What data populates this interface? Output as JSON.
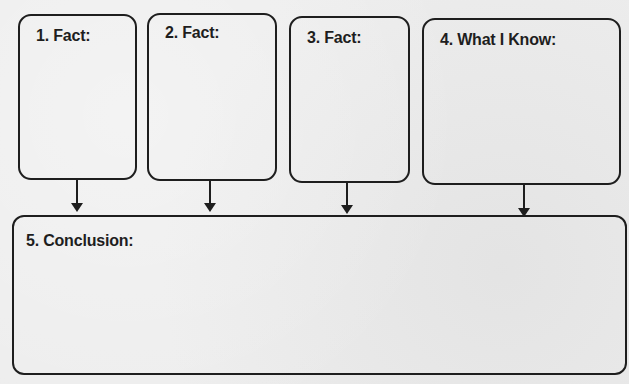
{
  "diagram": {
    "type": "graphic-organizer",
    "boxes": [
      {
        "id": 1,
        "label": "1. Fact:"
      },
      {
        "id": 2,
        "label": "2. Fact:"
      },
      {
        "id": 3,
        "label": "3. Fact:"
      },
      {
        "id": 4,
        "label": "4. What I Know:"
      },
      {
        "id": 5,
        "label": "5. Conclusion:"
      }
    ],
    "edges": [
      {
        "from": 1,
        "to": 5
      },
      {
        "from": 2,
        "to": 5
      },
      {
        "from": 3,
        "to": 5
      },
      {
        "from": 4,
        "to": 5
      }
    ],
    "colors": {
      "stroke": "#1e1e1e",
      "background": "#ededed"
    }
  }
}
